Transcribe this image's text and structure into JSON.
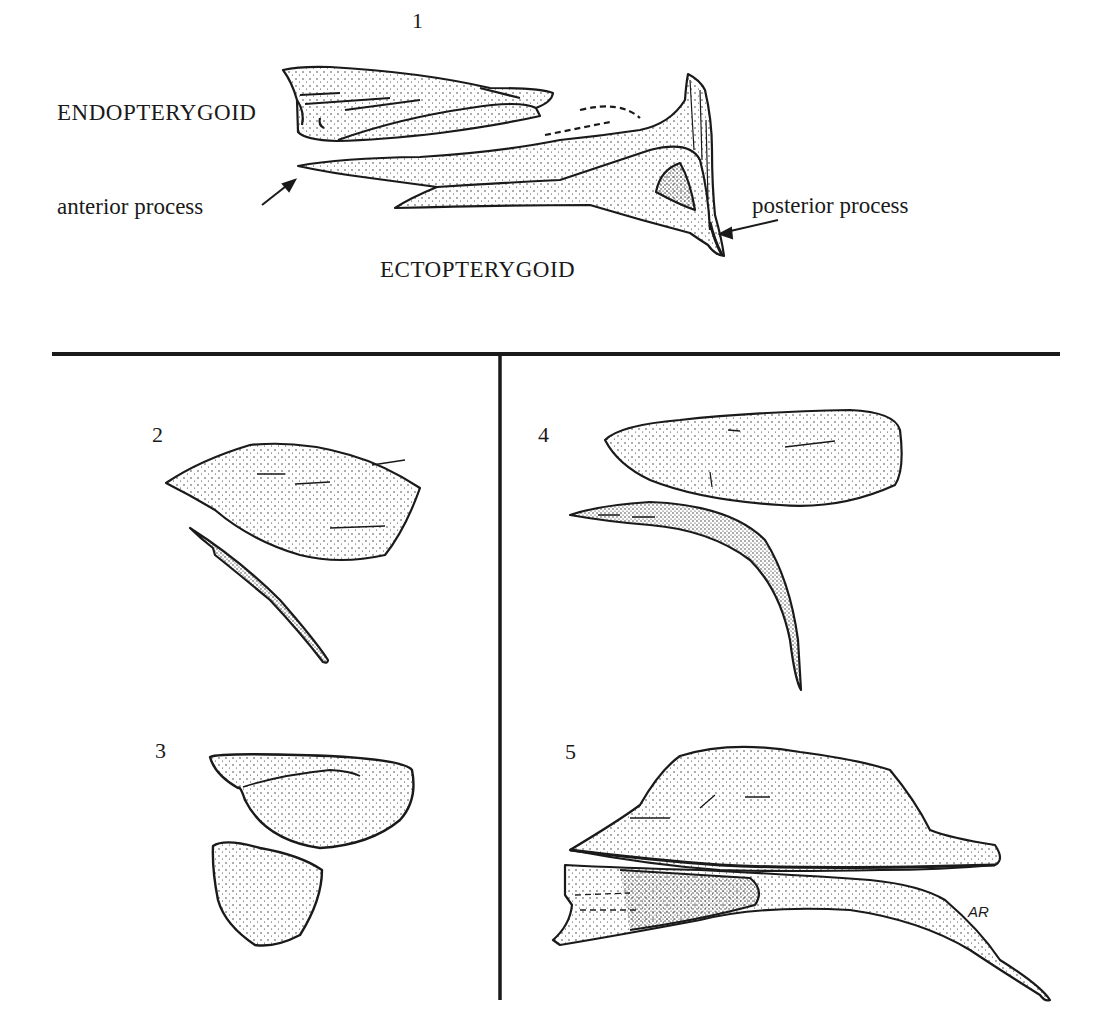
{
  "figure": {
    "panels": [
      {
        "id": "1",
        "number_label": "1",
        "labels": {
          "endopterygoid": "ENDOPTERYGOID",
          "ectopterygoid": "ECTOPTERYGOID",
          "anterior_process": "anterior  process",
          "posterior_process": "posterior process"
        }
      },
      {
        "id": "2",
        "number_label": "2"
      },
      {
        "id": "3",
        "number_label": "3"
      },
      {
        "id": "4",
        "number_label": "4"
      },
      {
        "id": "5",
        "number_label": "5",
        "signature": "AR"
      }
    ],
    "colors": {
      "ink": "#1a1a1a",
      "paper": "#ffffff"
    }
  }
}
